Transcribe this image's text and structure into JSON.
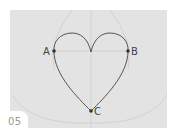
{
  "figure": {
    "step_number": "05",
    "points": [
      {
        "label": "A",
        "x": 54,
        "y": 51
      },
      {
        "label": "B",
        "x": 128,
        "y": 51
      },
      {
        "label": "C",
        "x": 91,
        "y": 111
      }
    ],
    "colors": {
      "panel_background": "#e3e3e3",
      "heart_stroke": "#555555",
      "construction_lines": "#cfcfcf",
      "label_text": "#444444",
      "step_text": "#9a9a9a"
    }
  }
}
